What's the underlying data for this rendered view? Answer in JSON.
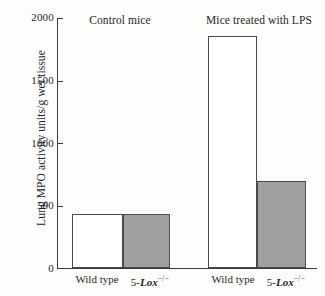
{
  "chart_data": {
    "type": "bar",
    "title": "",
    "xlabel": "",
    "ylabel": "Lung MPO activity units/g wet tissue",
    "ylim": [
      0,
      2000
    ],
    "yticks": [
      0,
      500,
      1000,
      1500,
      2000
    ],
    "ytick_labels": [
      "0",
      "500",
      "1000",
      "1500",
      "2000"
    ],
    "grid": false,
    "legend": "none",
    "groups": [
      {
        "label": "Control mice",
        "bars": [
          {
            "category_prefix": "Wild type",
            "category_gene": "",
            "category_sup": "",
            "value": 430,
            "fill": "white"
          },
          {
            "category_prefix": "5-",
            "category_gene": "Lox",
            "category_sup": "−/−",
            "value": 430,
            "fill": "gray"
          }
        ]
      },
      {
        "label": "Mice treated with LPS",
        "bars": [
          {
            "category_prefix": "Wild type",
            "category_gene": "",
            "category_sup": "",
            "value": 1860,
            "fill": "white"
          },
          {
            "category_prefix": "5-",
            "category_gene": "Lox",
            "category_sup": "−/−",
            "value": 700,
            "fill": "gray"
          }
        ]
      }
    ],
    "categories": [
      "Wild type",
      "5-Lox −/−",
      "Wild type",
      "5-Lox −/−"
    ],
    "values": [
      430,
      430,
      1860,
      700
    ],
    "series": [
      {
        "name": "Lung MPO activity",
        "values": [
          430,
          430,
          1860,
          700
        ]
      }
    ],
    "colors": {
      "wild_type_fill": "#ffffff",
      "knockout_fill": "#a0a0a0",
      "axis": "#3a3a3a",
      "bar_outline": "#4a4a4a",
      "background": "#fdfdfc",
      "text": "#1f1f1f"
    }
  }
}
